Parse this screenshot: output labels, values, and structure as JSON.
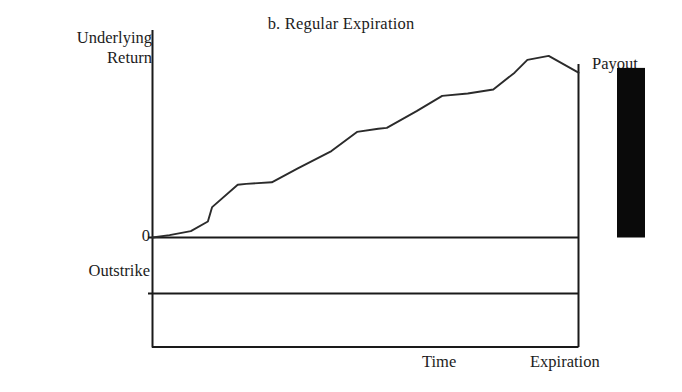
{
  "chart_data": {
    "type": "line",
    "title": "b. Regular Expiration",
    "xlabel": "Time",
    "ylabel": "Underlying Return",
    "grid": false,
    "legend": "none",
    "axis_labels": {
      "y_line1": "Underlying",
      "y_line2": "Return",
      "x_start": "Time",
      "x_end": "Expiration"
    },
    "reference_lines": [
      {
        "name": "zero-line",
        "label": "0",
        "y_value": 0
      },
      {
        "name": "outstrike-line",
        "label": "Outstrike",
        "y_value": -0.35
      }
    ],
    "series": [
      {
        "name": "underlying-return-path",
        "points": [
          [
            0.0,
            0.0
          ],
          [
            0.04,
            0.015
          ],
          [
            0.09,
            0.04
          ],
          [
            0.13,
            0.1
          ],
          [
            0.14,
            0.19
          ],
          [
            0.2,
            0.33
          ],
          [
            0.22,
            0.335
          ],
          [
            0.28,
            0.345
          ],
          [
            0.34,
            0.43
          ],
          [
            0.42,
            0.54
          ],
          [
            0.48,
            0.66
          ],
          [
            0.53,
            0.68
          ],
          [
            0.55,
            0.685
          ],
          [
            0.62,
            0.79
          ],
          [
            0.68,
            0.885
          ],
          [
            0.74,
            0.9
          ],
          [
            0.8,
            0.925
          ],
          [
            0.85,
            1.03
          ],
          [
            0.88,
            1.11
          ],
          [
            0.93,
            1.135
          ],
          [
            1.0,
            1.03
          ]
        ]
      }
    ],
    "payout_bar": {
      "label": "Payout",
      "color": "#0a0a0a",
      "top_value": 1.06,
      "bottom_value": 0.0
    },
    "ylim": [
      -0.82,
      1.33
    ],
    "xlim": [
      0,
      1
    ]
  }
}
